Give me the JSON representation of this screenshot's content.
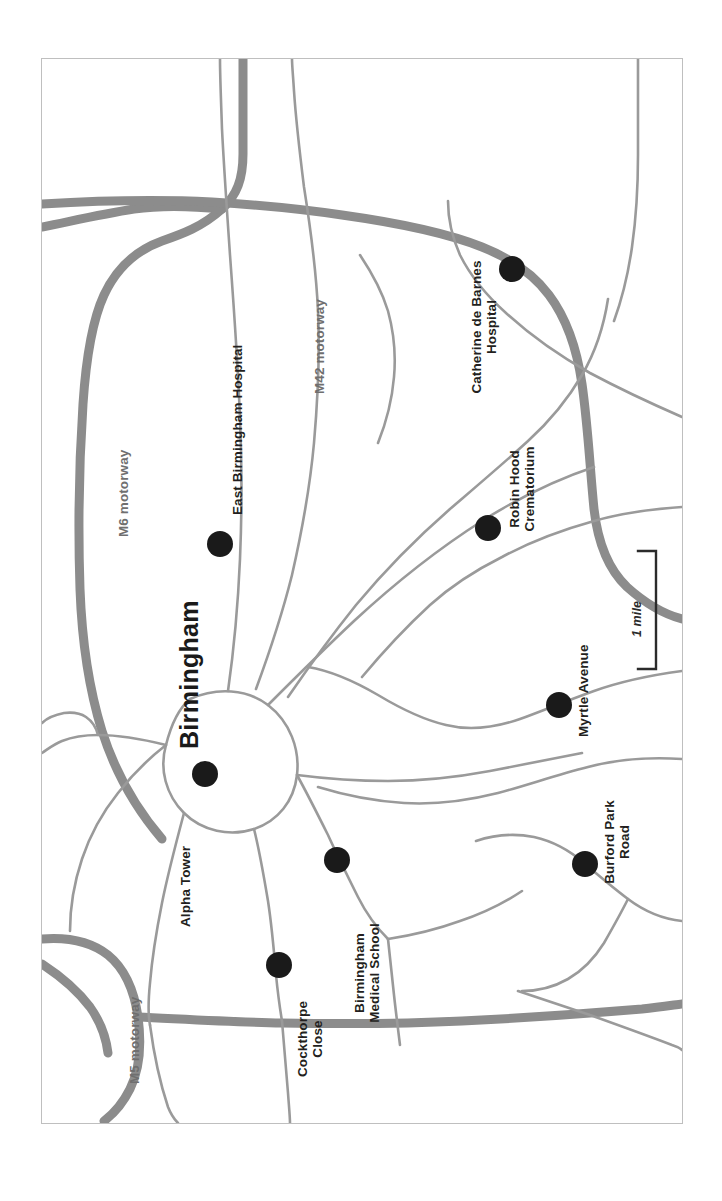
{
  "figure": {
    "kind": "map",
    "caption": "",
    "background_color": "#ffffff",
    "frame_color": "#bfbfbf",
    "orientation_note": "map rotated 90 degrees counter-clockwise; all labels read bottom-to-top"
  },
  "colors": {
    "motorway": "#8c8c8c",
    "road": "#9a9a9a",
    "dot": "#1a1a1a",
    "label": "#231f20",
    "motorway_label": "#6f6f6f",
    "city_label": "#1a1a1a",
    "frame": "#bfbfbf"
  },
  "city": {
    "name": "Birmingham"
  },
  "motorways": [
    {
      "id": "m6",
      "label": "M6 motorway"
    },
    {
      "id": "m42",
      "label": "M42 motorway"
    },
    {
      "id": "m5",
      "label": "M5 motorway"
    }
  ],
  "sites": [
    {
      "id": "east-birmingham-hospital",
      "label": "East Birmingham Hospital",
      "lines": [
        "East Birmingham Hospital"
      ],
      "marker": {
        "x": 219,
        "y": 543,
        "r": 13
      }
    },
    {
      "id": "catherine-de-barnes-hospital",
      "label": "Catherine de Barnes Hospital",
      "lines": [
        "Catherine de Barnes",
        "Hospital"
      ],
      "marker": {
        "x": 511,
        "y": 268,
        "r": 13
      }
    },
    {
      "id": "robin-hood-crematorium",
      "label": "Robin Hood Crematorium",
      "lines": [
        "Robin Hood",
        "Crematorium"
      ],
      "marker": {
        "x": 487,
        "y": 527,
        "r": 13
      }
    },
    {
      "id": "myrtle-avenue",
      "label": "Myrtle Avenue",
      "lines": [
        "Myrtle Avenue"
      ],
      "marker": {
        "x": 558,
        "y": 704,
        "r": 13
      }
    },
    {
      "id": "burford-park-road",
      "label": "Burford Park Road",
      "lines": [
        "Burford Park",
        "Road"
      ],
      "marker": {
        "x": 584,
        "y": 863,
        "r": 13
      }
    },
    {
      "id": "alpha-tower",
      "label": "Alpha Tower",
      "lines": [
        "Alpha Tower"
      ],
      "marker": {
        "x": 204,
        "y": 773,
        "r": 13
      }
    },
    {
      "id": "birmingham-medical-school",
      "label": "Birmingham Medical School",
      "lines": [
        "Birmingham",
        "Medical School"
      ],
      "marker": {
        "x": 336,
        "y": 859,
        "r": 13
      }
    },
    {
      "id": "cockthorpe-close",
      "label": "Cockthorpe Close",
      "lines": [
        "Cockthorpe",
        "Close"
      ],
      "marker": {
        "x": 278,
        "y": 964,
        "r": 13
      }
    }
  ],
  "scale_bar": {
    "label": "1 mile",
    "value": 1,
    "unit": "mile"
  }
}
